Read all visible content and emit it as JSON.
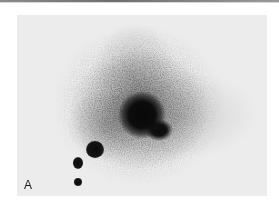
{
  "figure": {
    "panel_label": "A",
    "colors": {
      "background": "#ececec",
      "spot": "#0c0c0c",
      "label": "#1a1a1a",
      "top_rule": "#6e6e6e"
    },
    "spots": [
      {
        "id": "main-spot",
        "cx": 143,
        "cy": 114,
        "rx": 24,
        "ry": 24,
        "intensity": "saturated"
      },
      {
        "id": "main-spot-lobe",
        "cx": 159,
        "cy": 130,
        "rx": 14,
        "ry": 11,
        "intensity": "saturated"
      },
      {
        "id": "spot-large",
        "cx": 95,
        "cy": 151,
        "r": 8,
        "intensity": "high"
      },
      {
        "id": "spot-mid",
        "cx": 78,
        "cy": 163,
        "rx": 5,
        "ry": 6,
        "intensity": "high"
      },
      {
        "id": "spot-small",
        "cx": 78,
        "cy": 182,
        "r": 4,
        "intensity": "high"
      }
    ]
  }
}
